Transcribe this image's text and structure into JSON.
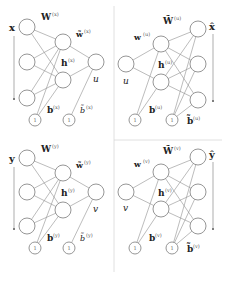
{
  "panels": [
    {
      "id": "x-encoder",
      "input_label": "x",
      "weight_label": "W",
      "weight_sup": "(x)",
      "out_weight_label": "w̃",
      "out_weight_sup": "(x)",
      "hidden_label": "h",
      "hidden_sup": "(x)",
      "output_label": "u",
      "bias_label": "b",
      "bias_sup": "(x)",
      "out_bias_label": "b̃",
      "out_bias_sup": "(x)",
      "bias_node_text": "1"
    },
    {
      "id": "x-decoder",
      "input_label": "u",
      "weight_label": "w",
      "weight_sup": "(u)",
      "out_weight_label": "W̃",
      "out_weight_sup": "(u)",
      "hidden_label": "h",
      "hidden_sup": "(u)",
      "output_label": "x̂",
      "bias_label": "b",
      "bias_sup": "(u)",
      "out_bias_label": "b̃",
      "out_bias_sup": "(u)",
      "bias_node_text": "1"
    },
    {
      "id": "y-encoder",
      "input_label": "y",
      "weight_label": "W",
      "weight_sup": "(y)",
      "out_weight_label": "w̃",
      "out_weight_sup": "(y)",
      "hidden_label": "h",
      "hidden_sup": "(y)",
      "output_label": "v",
      "bias_label": "b",
      "bias_sup": "(y)",
      "out_bias_label": "b̃",
      "out_bias_sup": "(y)",
      "bias_node_text": "1"
    },
    {
      "id": "y-decoder",
      "input_label": "v",
      "weight_label": "w",
      "weight_sup": "(v)",
      "out_weight_label": "W̃",
      "out_weight_sup": "(v)",
      "hidden_label": "h",
      "hidden_sup": "(v)",
      "output_label": "ŷ",
      "bias_label": "b",
      "bias_sup": "(v)",
      "out_bias_label": "b̃",
      "out_bias_sup": "(v)",
      "bias_node_text": "1"
    }
  ],
  "colors": {
    "node_stroke": "#8a8a8a",
    "edge": "#8f8f8f",
    "text": "#222222",
    "divider": "#d8d8d8"
  }
}
